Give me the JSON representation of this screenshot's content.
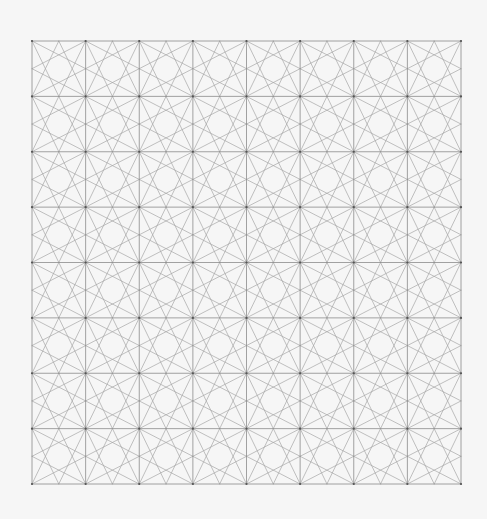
{
  "canvas": {
    "width": 487,
    "height": 519,
    "background": "#f6f6f6"
  },
  "pattern": {
    "name": "corner-to-opposite-midpoint star lattice",
    "origin_x": 32,
    "origin_y": 41,
    "width": 429,
    "height": 443,
    "cols": 8,
    "rows": 8,
    "grid_stroke": "#8c8c8c",
    "grid_stroke_width": 0.8,
    "motif_stroke": "#a6a6a6",
    "motif_stroke_width": 0.7,
    "vertex_color": "#555555",
    "vertex_radius": 1.1,
    "motif": "each cell: lines from each corner to the midpoints of the two opposite sides"
  }
}
